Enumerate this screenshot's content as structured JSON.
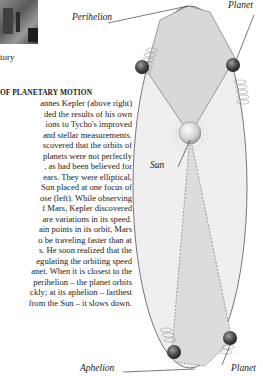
{
  "photo": {
    "caption": "tory"
  },
  "article": {
    "heading": "OF PLANETARY MOTION",
    "lines": [
      "annes Kepler (above right)",
      "ded the results of his own",
      "ions to Tycho's improved",
      "and stellar measurements.",
      "scovered that the orbits of",
      "planets were not perfectly",
      ", as had been believed for",
      "ears. They were elliptical,",
      "Sun placed at one focus of",
      "ose (left). While observing",
      "f Mars, Kepler discovered",
      "are variations in its speed.",
      "ain points in its orbit, Mars",
      "o be traveling faster than at",
      "s. He soon realized that the",
      "egulating the orbiting speed",
      "anet. When it is closest to the",
      "perihelion – the planet orbits",
      "ckly; at its aphelion – farthest",
      "from the Sun – it slows down."
    ]
  },
  "diagram": {
    "labels": {
      "perihelion": "Perihelion",
      "planet_top": "Planet",
      "sun": "Sun",
      "aphelion": "Aphelion",
      "planet_bottom": "Planet"
    },
    "colors": {
      "ellipse_fill": "#ececec",
      "sector_fill": "#d6d6d6",
      "sun": "#e0e0e0",
      "planet": "#5a5a5a"
    }
  }
}
